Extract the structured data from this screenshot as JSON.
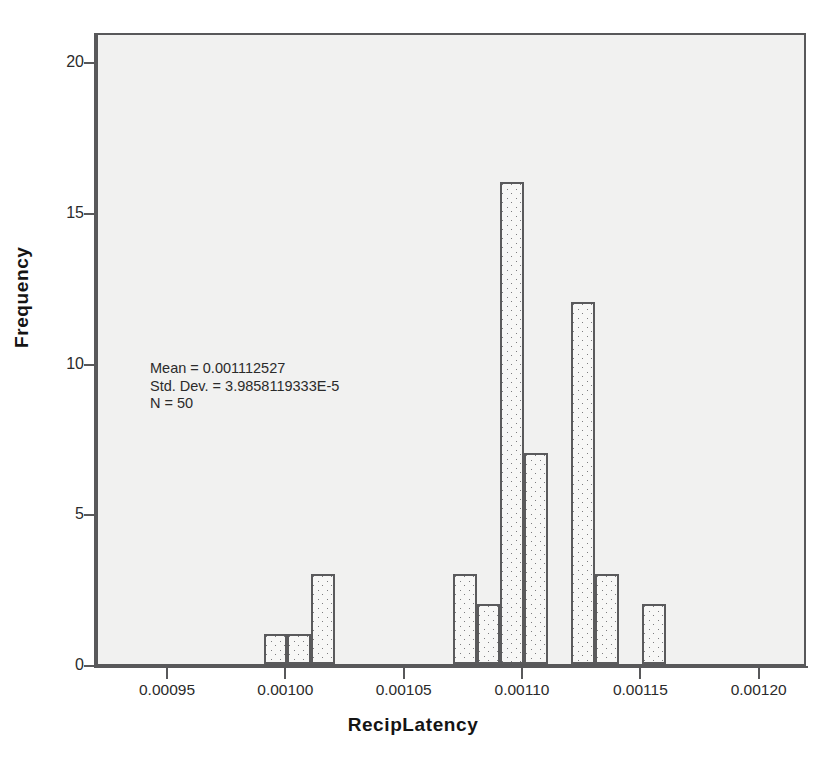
{
  "chart_data": {
    "type": "bar",
    "title": "",
    "xlabel": "RecipLatency",
    "ylabel": "Frequency",
    "xlim": [
      0.00092,
      0.00122
    ],
    "ylim": [
      0,
      21
    ],
    "grid": false,
    "legend": "none",
    "bin_width": 1e-05,
    "x_ticks": [
      "0.00095",
      "0.00100",
      "0.00105",
      "0.00110",
      "0.00115",
      "0.00120"
    ],
    "x_tick_values": [
      0.00095,
      0.001,
      0.00105,
      0.0011,
      0.00115,
      0.0012
    ],
    "y_ticks": [
      "0",
      "5",
      "10",
      "15",
      "20"
    ],
    "y_tick_values": [
      0,
      5,
      10,
      15,
      20
    ],
    "bins": [
      {
        "start": 0.00099,
        "end": 0.001,
        "count": 1
      },
      {
        "start": 0.001,
        "end": 0.00101,
        "count": 1
      },
      {
        "start": 0.00101,
        "end": 0.00102,
        "count": 3
      },
      {
        "start": 0.00104,
        "end": 0.00105,
        "count": 0
      },
      {
        "start": 0.00107,
        "end": 0.00108,
        "count": 3
      },
      {
        "start": 0.00108,
        "end": 0.00109,
        "count": 2
      },
      {
        "start": 0.00109,
        "end": 0.0011,
        "count": 16
      },
      {
        "start": 0.0011,
        "end": 0.00111,
        "count": 7
      },
      {
        "start": 0.00112,
        "end": 0.00113,
        "count": 12
      },
      {
        "start": 0.00113,
        "end": 0.00114,
        "count": 3
      },
      {
        "start": 0.00115,
        "end": 0.00116,
        "count": 2
      }
    ],
    "categories": [
      "0.00099",
      "0.00100",
      "0.00101",
      "0.00104",
      "0.00107",
      "0.00108",
      "0.00109",
      "0.00110",
      "0.00112",
      "0.00113",
      "0.00115"
    ],
    "values": [
      1,
      1,
      3,
      0,
      3,
      2,
      16,
      7,
      12,
      3,
      2
    ],
    "annotations": {
      "mean_label": "Mean = 0.001112527",
      "std_dev_label": "Std. Dev. = 3.9858119333E-5",
      "n_label": "N = 50",
      "mean": 0.001112527,
      "std_dev": 3.9858119333e-05,
      "n": 50
    }
  },
  "colors": {
    "page_background": "#ffffff",
    "plot_background": "#f1f1f0",
    "axis": "#58585a",
    "bar_outline": "#5a5a5c",
    "bar_fill": "#f7f7f6",
    "bar_stipple": "#7d7d80",
    "text": "#2b2b2b",
    "title_text": "#141414"
  }
}
